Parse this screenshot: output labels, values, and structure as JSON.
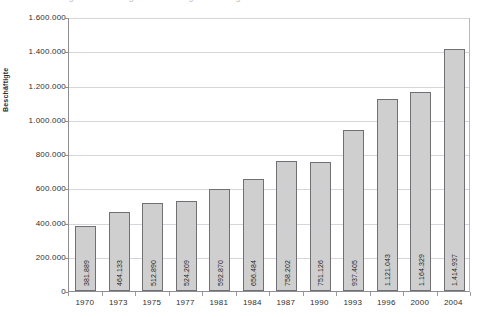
{
  "title_remnant": "Abbildung 1: Entwicklung der Beschäftigten im Pflegebereich",
  "axis": {
    "y_title": "Beschäftigte",
    "y_ticks": [
      "0",
      "200.000",
      "400.000",
      "600.000",
      "800.000",
      "1.000.000",
      "1.200.000",
      "1.400.000",
      "1.600.000"
    ]
  },
  "chart_data": {
    "type": "bar",
    "title": "",
    "xlabel": "",
    "ylabel": "Beschäftigte",
    "ylim": [
      0,
      1600000
    ],
    "ytick_step": 200000,
    "grid": true,
    "legend": "none",
    "categories": [
      "1970",
      "1973",
      "1975",
      "1977",
      "1981",
      "1984",
      "1987",
      "1990",
      "1993",
      "1996",
      "2000",
      "2004"
    ],
    "values": [
      381889,
      464133,
      512890,
      524209,
      592870,
      656484,
      758202,
      751126,
      937405,
      1121043,
      1164329,
      1414937
    ],
    "value_labels": [
      "381.889",
      "464.133",
      "512.890",
      "524.209",
      "592.870",
      "656.484",
      "758.202",
      "751.126",
      "937.405",
      "1.121.043",
      "1.164.329",
      "1.414.937"
    ],
    "bar_color": "#cfcfcf",
    "bar_border_color": "#6f6f74",
    "gridline_color": "#d6d6da",
    "axis_color": "#8d8d92"
  }
}
